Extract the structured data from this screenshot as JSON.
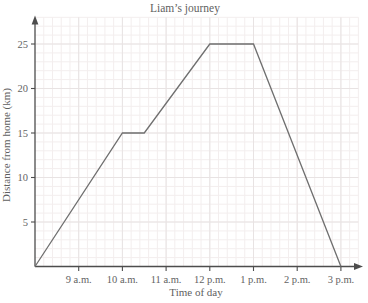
{
  "chart_data": {
    "type": "line",
    "title": "Liam’s journey",
    "xlabel": "Time of day",
    "ylabel": "Distance from home (km)",
    "x_ticks": [
      {
        "t": 9,
        "label": "9 a.m."
      },
      {
        "t": 10,
        "label": "10 a.m."
      },
      {
        "t": 11,
        "label": "11 a.m."
      },
      {
        "t": 12,
        "label": "12 p.m."
      },
      {
        "t": 13,
        "label": "1 p.m."
      },
      {
        "t": 14,
        "label": "2 p.m."
      },
      {
        "t": 15,
        "label": "3 p.m."
      }
    ],
    "y_ticks": [
      5,
      10,
      15,
      20,
      25
    ],
    "series": [
      {
        "name": "Liam",
        "points": [
          {
            "t": 8,
            "km": 0
          },
          {
            "t": 10,
            "km": 15
          },
          {
            "t": 10.5,
            "km": 15
          },
          {
            "t": 12,
            "km": 25
          },
          {
            "t": 13,
            "km": 25
          },
          {
            "t": 15,
            "km": 0
          }
        ]
      }
    ],
    "xlim_hours": [
      8,
      15.4
    ],
    "ylim_km": [
      0,
      28
    ],
    "grid": {
      "minor_x_hours": 0.2,
      "minor_y_km": 1,
      "major_x_hours": 1,
      "major_y_km": 5,
      "visible": true
    },
    "legend": "none",
    "colors": {
      "line": "#6f6f6f",
      "axis": "#4d4d4d",
      "tick_text": "#636363",
      "title_text": "#5f5f5f",
      "grid_minor": "#f3eeee",
      "grid_major": "#e8e3e3",
      "background": "#ffffff"
    }
  }
}
